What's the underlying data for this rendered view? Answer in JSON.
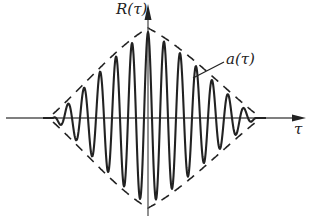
{
  "diagram": {
    "labels": {
      "y_axis": "R(τ)",
      "x_axis": "τ",
      "envelope": "a(τ)"
    },
    "colors": {
      "ink": "#222222",
      "axis": "#555555",
      "background": "#ffffff"
    },
    "geometry": {
      "width": 325,
      "height": 219,
      "origin_x": 148,
      "origin_y": 118,
      "x_axis_start": 6,
      "x_axis_end": 262,
      "y_axis_top": 4,
      "y_axis_bottom": 216,
      "amplitude_px": 86,
      "half_width_left_px": 95,
      "half_width_right_px": 108,
      "cycles_per_px": 0.0625
    },
    "elements": [
      {
        "name": "R(τ)",
        "kind": "oscillating curve",
        "style": "solid"
      },
      {
        "name": "a(τ)",
        "kind": "envelope",
        "style": "dashed"
      }
    ]
  }
}
